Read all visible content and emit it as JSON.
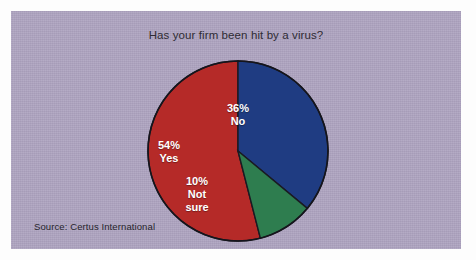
{
  "figure": {
    "title": "Has your firm been hit by a virus?",
    "source": "Source: Certus International",
    "background_color": "#ada3c0",
    "page_color": "#ffffff"
  },
  "chart_data": {
    "type": "pie",
    "title": "Has your firm been hit by a virus?",
    "xlabel": "",
    "ylabel": "",
    "legend": "none (labels drawn inside slices)",
    "start_angle_deg": 0,
    "direction": "clockwise",
    "labels": [
      "No",
      "Not sure",
      "Yes"
    ],
    "values": [
      36,
      10,
      54
    ],
    "unit": "%",
    "colors": [
      "#1f3c82",
      "#2e7d4f",
      "#b52a28"
    ],
    "slices": [
      {
        "name": "No",
        "percent_label": "36%",
        "value": 36,
        "color": "#1f3c82",
        "start_deg": 0,
        "end_deg": 129.6
      },
      {
        "name": "Not sure",
        "percent_label": "10%",
        "value": 10,
        "color": "#2e7d4f",
        "start_deg": 129.6,
        "end_deg": 165.6
      },
      {
        "name": "Yes",
        "percent_label": "54%",
        "value": 54,
        "color": "#b52a28",
        "start_deg": 165.6,
        "end_deg": 360
      }
    ],
    "annotations": [
      "Source: Certus International"
    ]
  },
  "labels": {
    "no": {
      "pct": "36%",
      "line1": "No",
      "line2": ""
    },
    "yes": {
      "pct": "54%",
      "line1": "Yes",
      "line2": ""
    },
    "not_sure": {
      "pct": "10%",
      "line1": "Not",
      "line2": "sure"
    }
  }
}
